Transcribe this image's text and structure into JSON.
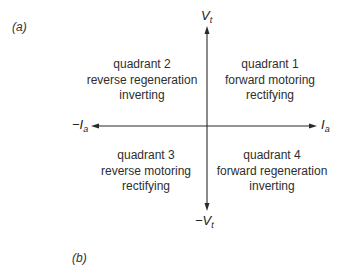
{
  "figure": {
    "label_a": "(a)",
    "label_b": "(b)",
    "axes": {
      "v_pos": {
        "sym": "V",
        "sub": "t",
        "prefix": ""
      },
      "v_neg": {
        "sym": "V",
        "sub": "t",
        "prefix": "−"
      },
      "i_pos": {
        "sym": "I",
        "sub": "a",
        "prefix": ""
      },
      "i_neg": {
        "sym": "I",
        "sub": "a",
        "prefix": "−"
      }
    },
    "quadrants": {
      "q1": {
        "title": "quadrant 1",
        "mode": "forward motoring",
        "converter": "rectifying"
      },
      "q2": {
        "title": "quadrant 2",
        "mode": "reverse regeneration",
        "converter": "inverting"
      },
      "q3": {
        "title": "quadrant 3",
        "mode": "reverse motoring",
        "converter": "rectifying"
      },
      "q4": {
        "title": "quadrant 4",
        "mode": "forward regeneration",
        "converter": "inverting"
      }
    },
    "colors": {
      "line": "#2a2a2a",
      "text": "#2e2e2e",
      "background": "#ffffff"
    }
  }
}
